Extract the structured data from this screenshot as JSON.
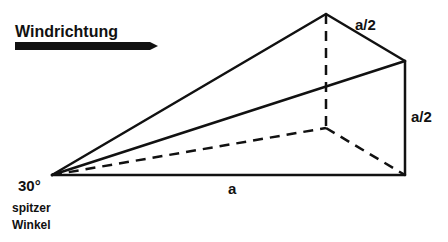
{
  "diagram": {
    "title": "Windrichtung",
    "labels": {
      "top_edge": "a/2",
      "right_edge": "a/2",
      "bottom_edge": "a",
      "angle": "30°",
      "angle_caption_line1": "spitzer",
      "angle_caption_line2": "Winkel"
    },
    "vertices": {
      "apex": [
        52,
        175
      ],
      "top_back": [
        326,
        14
      ],
      "top_front": [
        405,
        61
      ],
      "bottom_front": [
        405,
        175
      ],
      "bottom_back": [
        326,
        128
      ]
    },
    "colors": {
      "stroke": "#111111",
      "background": "#ffffff"
    }
  }
}
